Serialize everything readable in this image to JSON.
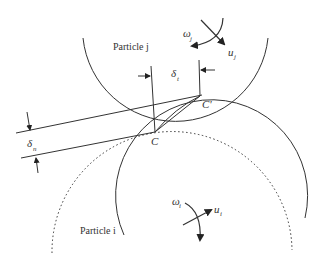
{
  "diagram": {
    "type": "particle-contact-schematic",
    "particles": {
      "j": {
        "label": "Particle j",
        "angular_velocity": "ω",
        "angular_velocity_sub": "j",
        "velocity": "u",
        "velocity_sub": "j"
      },
      "i": {
        "label": "Particle i",
        "angular_velocity": "ω",
        "angular_velocity_sub": "i",
        "velocity": "u",
        "velocity_sub": "i"
      }
    },
    "contact_points": {
      "c": "C",
      "c_prime": "C'"
    },
    "displacements": {
      "tangential": {
        "symbol": "δ",
        "sub": "t"
      },
      "normal": {
        "symbol": "δ",
        "sub": "n"
      }
    },
    "colors": {
      "line": "#333333",
      "background": "#ffffff"
    }
  }
}
